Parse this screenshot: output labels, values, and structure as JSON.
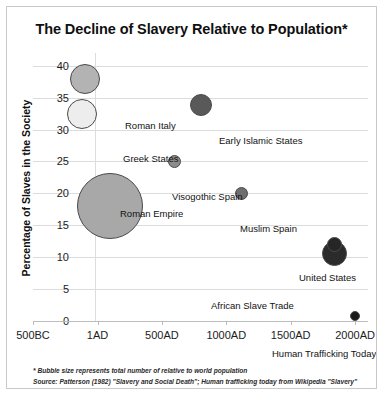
{
  "chart_data": {
    "type": "scatter",
    "title": "The Decline of Slavery Relative to Population*",
    "xlabel": "",
    "ylabel": "Percentage of Slaves in the Society",
    "xlim": [
      -500,
      2100
    ],
    "ylim": [
      0,
      42
    ],
    "grid": true,
    "legend": "none",
    "bubble_note": "Bubble size represents total number of relative to world population",
    "x_ticks": [
      "500BC",
      "1AD",
      "500AD",
      "1000AD",
      "1500AD",
      "2000AD"
    ],
    "x_tick_values": [
      -500,
      1,
      500,
      1000,
      1500,
      2000
    ],
    "y_ticks": [
      "0",
      "5",
      "10",
      "15",
      "20",
      "25",
      "30",
      "35",
      "40"
    ],
    "y_tick_values": [
      0,
      5,
      10,
      15,
      20,
      25,
      30,
      35,
      40
    ],
    "points": [
      {
        "label": "Roman Italy",
        "x": -100,
        "y": 38,
        "size": 30,
        "color": "#b3b3b3",
        "label_x": 92,
        "label_y": 67
      },
      {
        "label": "Greek States",
        "x": -120,
        "y": 32.5,
        "size": 30,
        "color": "#ededed",
        "label_x": 90,
        "label_y": 100
      },
      {
        "label": "Roman Empire",
        "x": 100,
        "y": 18,
        "size": 66,
        "color": "#a8a8a8",
        "label_x": 87,
        "label_y": 155
      },
      {
        "label": "Visogothic Spain",
        "x": 600,
        "y": 25,
        "size": 13,
        "color": "#8c8c8c",
        "label_x": 139,
        "label_y": 138
      },
      {
        "label": "Early Islamic States",
        "x": 800,
        "y": 33.8,
        "size": 22,
        "color": "#595959",
        "label_x": 186,
        "label_y": 82
      },
      {
        "label": "Muslim Spain",
        "x": 1120,
        "y": 20,
        "size": 13,
        "color": "#6e6e6e",
        "label_x": 207,
        "label_y": 170
      },
      {
        "label": "United States",
        "x": 1840,
        "y": 12,
        "size": 15,
        "color": "#262626",
        "label_x": 266,
        "label_y": 219
      },
      {
        "label": "African Slave Trade",
        "x": 1840,
        "y": 10.6,
        "size": 25,
        "color": "#2b2b2b",
        "label_x": 178,
        "label_y": 247
      },
      {
        "label": "Human Trafficking Today",
        "x": 2000,
        "y": 0.8,
        "size": 10,
        "color": "#1a1a1a",
        "label_x": 239,
        "label_y": 295
      }
    ]
  },
  "footnotes": {
    "line1": "* Bubble size represents total number of relative to world population",
    "line2": "Source: Patterson (1982) \"Slavery and Social Death\"; Human trafficking today from Wikipedia \"Slavery\""
  }
}
